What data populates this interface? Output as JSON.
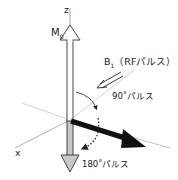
{
  "diagram": {
    "axes": {
      "z_label": "z",
      "x_label": "x"
    },
    "vectors": {
      "m0": {
        "label_main": "M",
        "label_sub": "0",
        "direction": "+z",
        "style": "white-outlined"
      },
      "after_90": {
        "direction": "transverse (y)",
        "style": "solid-black"
      },
      "after_180": {
        "direction": "-z",
        "style": "gray-filled"
      }
    },
    "b1": {
      "label_main": "B",
      "label_sub": "1",
      "label_rest": "（RFパルス）"
    },
    "rotations": {
      "ninety": "90˚パルス",
      "one_eighty": "180˚パルス"
    },
    "colors": {
      "axis_line": "#b8b8b8",
      "outline": "#333333",
      "vector_black": "#111111",
      "vector_gray": "#c8c8c8"
    }
  }
}
